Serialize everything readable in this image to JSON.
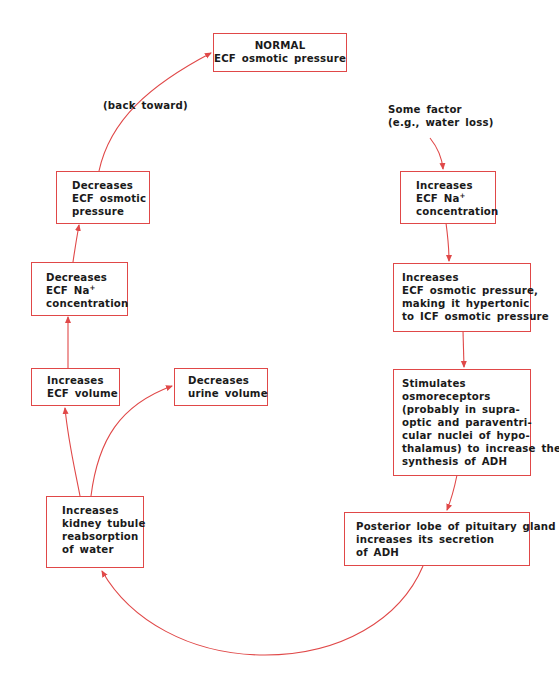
{
  "diagram": {
    "type": "feedback-loop flowchart",
    "accent_color": "#e04848",
    "text_color": "#1a1a1a",
    "nodes": {
      "normal": {
        "lines": [
          "NORMAL",
          "ECF osmotic pressure"
        ]
      },
      "back_toward_label": "(back toward)",
      "some_factor": {
        "lines": [
          "Some factor",
          "(e.g., water loss)"
        ]
      },
      "inc_na": {
        "lines": [
          "Increases",
          "ECF Na",
          "concentration"
        ],
        "superscript": "+"
      },
      "inc_osm": {
        "lines": [
          "Increases",
          "ECF osmotic pressure,",
          "making it hypertonic",
          "to ICF osmotic pressure"
        ]
      },
      "osmoreceptors": {
        "lines": [
          "Stimulates",
          "osmoreceptors",
          "(probably in supra-",
          "optic and paraventri-",
          "cular nuclei of hypo-",
          "thalamus)  to increase their",
          "synthesis of ADH"
        ]
      },
      "pituitary": {
        "lines": [
          "Posterior lobe of pituitary gland",
          "increases its secretion",
          "of ADH"
        ]
      },
      "kidney": {
        "lines": [
          "Increases",
          "kidney tubule",
          "reabsorption",
          "of water"
        ]
      },
      "inc_vol": {
        "lines": [
          "Increases",
          "ECF volume"
        ]
      },
      "dec_urine": {
        "lines": [
          "Decreases",
          "urine volume"
        ]
      },
      "dec_na": {
        "lines": [
          "Decreases",
          "ECF Na",
          "concentration"
        ],
        "superscript": "+"
      },
      "dec_osm": {
        "lines": [
          "Decreases",
          "ECF osmotic",
          "pressure"
        ]
      }
    },
    "edges": [
      [
        "some_factor",
        "inc_na"
      ],
      [
        "inc_na",
        "inc_osm"
      ],
      [
        "inc_osm",
        "osmoreceptors"
      ],
      [
        "osmoreceptors",
        "pituitary"
      ],
      [
        "pituitary",
        "kidney"
      ],
      [
        "kidney",
        "inc_vol"
      ],
      [
        "kidney",
        "dec_urine"
      ],
      [
        "inc_vol",
        "dec_na"
      ],
      [
        "dec_na",
        "dec_osm"
      ],
      [
        "dec_osm",
        "normal"
      ]
    ]
  }
}
